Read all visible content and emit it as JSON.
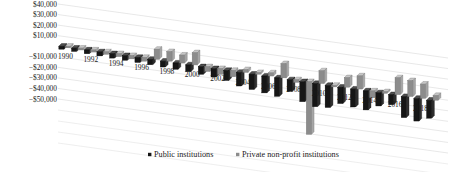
{
  "chart_data": {
    "type": "bar",
    "title": "",
    "subtitle": "",
    "xlabel": "",
    "ylabel": "",
    "ylim": [
      -50000,
      40000
    ],
    "ytick_values": [
      40000,
      30000,
      20000,
      10000,
      0,
      -10000,
      -20000,
      -30000,
      -40000,
      -50000
    ],
    "ytick_labels": [
      "$40,000",
      "$30,000",
      "$20,000",
      "$10,000",
      "$0",
      "−$10,000",
      "−$20,000",
      "−$30,000",
      "−$40,000",
      "−$50,000"
    ],
    "grid": true,
    "projection": "3d-perspective",
    "legend_position": "bottom",
    "categories": [
      "1990",
      "1991",
      "1992",
      "1993",
      "1994",
      "1995",
      "1996",
      "1997",
      "1998",
      "1999",
      "2000",
      "2001",
      "2002",
      "2003",
      "2004",
      "2005",
      "2006",
      "2007",
      "2008",
      "2009",
      "2010",
      "2011",
      "2012",
      "2013",
      "2014",
      "2015",
      "2016",
      "2017",
      "2018",
      "2019"
    ],
    "xtick_labels_shown": [
      "1990",
      "1992",
      "1994",
      "1996",
      "1998",
      "2000",
      "2002",
      "2004",
      "2006",
      "2008",
      "2010",
      "2012",
      "2014",
      "2016",
      "2018"
    ],
    "series": [
      {
        "name": "Public institutions",
        "color": "#161616",
        "values": [
          -2800,
          -3200,
          -3600,
          -3900,
          -4200,
          -4500,
          -4800,
          -5200,
          -5600,
          -6000,
          -6500,
          -7200,
          -8000,
          -9500,
          -13000,
          -14500,
          -16000,
          -17500,
          -11000,
          -19000,
          -22000,
          -21000,
          -15500,
          -17000,
          -18000,
          -12500,
          -9500,
          -20000,
          -21500,
          -17000
        ]
      },
      {
        "name": "Private non-profit institutions",
        "color": "#8c8c8c",
        "values": [
          -1500,
          -1800,
          -2000,
          -2400,
          -2800,
          -3200,
          -3600,
          9500,
          9000,
          7500,
          11500,
          -4500,
          -5500,
          -6000,
          2500,
          1500,
          3000,
          13500,
          -2500,
          -50000,
          12000,
          -1000,
          9000,
          12500,
          -6500,
          1000,
          16000,
          15000,
          13500,
          4500
        ]
      }
    ]
  },
  "legend": {
    "items": [
      {
        "label": "Public institutions",
        "color": "#161616"
      },
      {
        "label": "Private non-profit institutions",
        "color": "#8c8c8c"
      }
    ]
  }
}
